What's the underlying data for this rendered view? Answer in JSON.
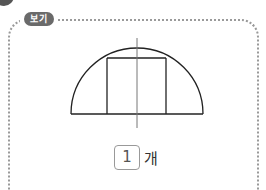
{
  "badge": {
    "label": "보기"
  },
  "figure": {
    "line_color": "#222222",
    "axis_color": "#777777"
  },
  "answer": {
    "value": "1",
    "unit": "개"
  }
}
